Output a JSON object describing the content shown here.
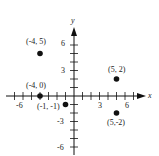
{
  "chart_data": {
    "type": "scatter",
    "title": "",
    "xlabel": "x",
    "ylabel": "y",
    "xlim": [
      -7,
      8
    ],
    "ylim": [
      -6,
      7
    ],
    "grid": false,
    "x_tick_labels": [
      {
        "value": -6,
        "label": "-6"
      },
      {
        "value": 3,
        "label": "3"
      },
      {
        "value": 6,
        "label": "6"
      }
    ],
    "y_tick_labels": [
      {
        "value": 6,
        "label": "6"
      },
      {
        "value": 3,
        "label": "3"
      },
      {
        "value": -3,
        "label": "-3"
      },
      {
        "value": -6,
        "label": "-6"
      }
    ],
    "points": [
      {
        "x": -4,
        "y": 5,
        "label": "(-4, 5)"
      },
      {
        "x": -4,
        "y": 0,
        "label": "(-4, 0)"
      },
      {
        "x": -1,
        "y": -1,
        "label": "(-1, -1)"
      },
      {
        "x": 5,
        "y": 2,
        "label": "(5, 2)"
      },
      {
        "x": 5,
        "y": -2,
        "label": "(5,-2)"
      }
    ]
  },
  "axes": {
    "x_label": "x",
    "y_label": "y"
  },
  "ticks": {
    "x_neg6": "-6",
    "x_3": "3",
    "x_6": "6",
    "y_6": "6",
    "y_3": "3",
    "y_neg3": "-3",
    "y_neg6": "-6"
  },
  "labels": {
    "p1": "(-4, 5)",
    "p2": "(-4, 0)",
    "p3": "(-1, -1)",
    "p4": "(5, 2)",
    "p5": "(5,-2)"
  },
  "colors": {
    "ink": "#111111",
    "label": "#222222"
  }
}
